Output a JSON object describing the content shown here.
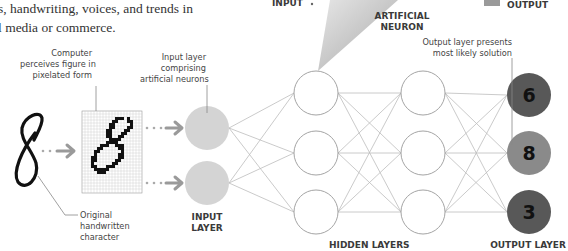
{
  "intro_text": {
    "line1": "s, handwriting, voices, and trends in",
    "line2": "l media or commerce."
  },
  "top_labels": {
    "input": "INPUT",
    "artificial_neuron_line1": "ARTIFICIAL",
    "artificial_neuron_line2": "NEURON",
    "output": "OUTPUT"
  },
  "annotations": {
    "computer_perceives": [
      "Computer",
      "perceives figure in",
      "pixelated form"
    ],
    "input_layer_note": [
      "Input layer",
      "comprising",
      "artificial neurons"
    ],
    "output_layer_note": [
      "Output layer presents",
      "most likely solution"
    ],
    "original_character": [
      "Original",
      "handwritten",
      "character"
    ]
  },
  "handwritten_character": "8",
  "layer_labels": {
    "input_line1": "INPUT",
    "input_line2": "LAYER",
    "hidden": "HIDDEN LAYERS",
    "output": "OUTPUT LAYER"
  },
  "output_neurons": [
    {
      "value": "6",
      "color": "#585858"
    },
    {
      "value": "8",
      "color": "#8a8a8a"
    },
    {
      "value": "3",
      "color": "#585858"
    }
  ],
  "colors": {
    "input_neuron": "#d4d4d4",
    "arrow": "#9a9a9a",
    "connection_line": "#b5b5b5",
    "hidden_neuron_stroke": "#9a9a9a"
  }
}
